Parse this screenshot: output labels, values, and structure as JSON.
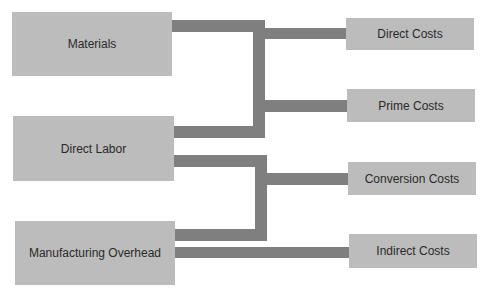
{
  "diagram": {
    "title": "",
    "sources": [
      {
        "id": "materials",
        "label": "Materials"
      },
      {
        "id": "direct-labor",
        "label": "Direct Labor"
      },
      {
        "id": "manufacturing-overhead",
        "label": "Manufacturing Overhead"
      }
    ],
    "targets": [
      {
        "id": "direct-costs",
        "label": "Direct Costs"
      },
      {
        "id": "prime-costs",
        "label": "Prime Costs"
      },
      {
        "id": "conversion-costs",
        "label": "Conversion Costs"
      },
      {
        "id": "indirect-costs",
        "label": "Indirect Costs"
      }
    ],
    "connections": [
      {
        "from": [
          "materials",
          "direct-labor"
        ],
        "to": [
          "direct-costs",
          "prime-costs"
        ]
      },
      {
        "from": [
          "direct-labor",
          "manufacturing-overhead"
        ],
        "to": [
          "conversion-costs"
        ]
      },
      {
        "from": [
          "manufacturing-overhead"
        ],
        "to": [
          "indirect-costs"
        ]
      }
    ],
    "colors": {
      "box": "#bcbcbc",
      "connector": "#7f7f7f",
      "text": "#2a2a2a",
      "background": "#ffffff"
    }
  }
}
